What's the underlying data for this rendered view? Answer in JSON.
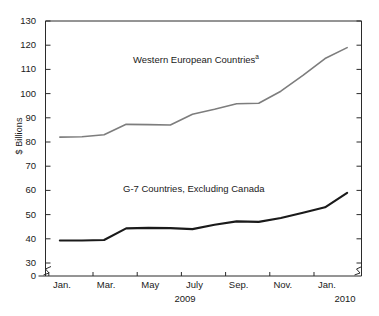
{
  "chart_data": {
    "type": "line",
    "title": "",
    "subtitle": "",
    "xlabel": "",
    "ylabel": "$ Billions",
    "ylim": [
      30,
      130
    ],
    "ytick_values": [
      30,
      40,
      50,
      60,
      70,
      80,
      90,
      100,
      110,
      120,
      130
    ],
    "ytick_labels": [
      "30",
      "40",
      "50",
      "60",
      "70",
      "80",
      "90",
      "100",
      "110",
      "120",
      "130"
    ],
    "y_zero_label": "0",
    "y_axis_break": true,
    "y_axis_break_symbol": "squiggle",
    "grid": false,
    "legend_position": "inline-annotation",
    "x": [
      "Jan. 2009",
      "Feb. 2009",
      "Mar. 2009",
      "Apr. 2009",
      "May 2009",
      "June 2009",
      "July 2009",
      "Aug. 2009",
      "Sep. 2009",
      "Oct. 2009",
      "Nov. 2009",
      "Dec. 2009",
      "Jan. 2010",
      "Feb. 2010"
    ],
    "xtick_labels": [
      "Jan.",
      "Mar.",
      "May",
      "July",
      "Sep.",
      "Nov.",
      "Jan."
    ],
    "year_labels": [
      "2009",
      "2010"
    ],
    "series": [
      {
        "name": "Western European Countries",
        "footnote_marker": "a",
        "color": "#7d7d7d",
        "line_width": 1.6,
        "values": [
          82.0,
          82.2,
          83.0,
          87.3,
          87.2,
          87.0,
          91.5,
          93.5,
          95.8,
          96.0,
          101.0,
          107.5,
          114.5,
          119.0
        ]
      },
      {
        "name": "G-7 Countries, Excluding Canada",
        "footnote_marker": "",
        "color": "#1a1a1a",
        "line_width": 2.1,
        "values": [
          39.3,
          39.3,
          39.5,
          44.3,
          44.5,
          44.4,
          44.0,
          45.8,
          47.2,
          47.0,
          48.6,
          50.8,
          53.0,
          59.0
        ]
      }
    ]
  },
  "axis": {
    "left_break_name": "y-axis-break-left",
    "right_break_name": "y-axis-break-right"
  }
}
